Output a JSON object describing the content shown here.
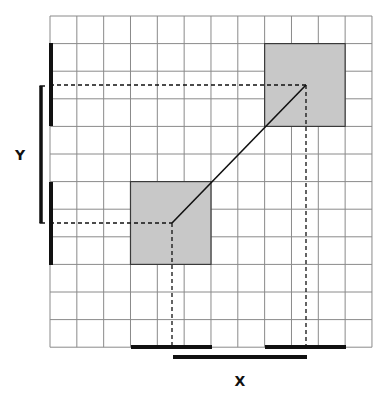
{
  "diagram": {
    "type": "grid-displacement",
    "grid": {
      "origin_x": 50,
      "origin_y": 16,
      "cols": 12,
      "rows": 12,
      "cell_width": 26.83,
      "cell_height": 27.6,
      "line_color": "#8a8a8a"
    },
    "squares": [
      {
        "name": "lower-left-square",
        "col": 3,
        "row": 6,
        "span_cols": 3,
        "span_rows": 3
      },
      {
        "name": "upper-right-square",
        "col": 8,
        "row": 1,
        "span_cols": 3,
        "span_rows": 3
      }
    ],
    "square_fill": "#c8c8c8",
    "square_stroke": "#3a3a3a",
    "centers": [
      {
        "name": "lower-left-center",
        "x": 172,
        "y": 223
      },
      {
        "name": "upper-right-center",
        "x": 306,
        "y": 85
      }
    ],
    "y_axis": {
      "label": "Y",
      "label_x": 20,
      "label_y": 160,
      "edge_bars": [
        {
          "x": 51,
          "y1": 43,
          "y2": 126
        },
        {
          "x": 51,
          "y1": 182,
          "y2": 265
        }
      ],
      "bracket": {
        "x": 41,
        "y1": 86,
        "y2": 223
      }
    },
    "x_axis": {
      "label": "X",
      "label_x": 240,
      "label_y": 386,
      "edge_bars": [
        {
          "y": 347,
          "x1": 131,
          "x2": 212
        },
        {
          "y": 347,
          "x1": 265,
          "x2": 346
        }
      ],
      "distance_bar": {
        "y": 357,
        "x1": 173,
        "x2": 307
      }
    },
    "ink_color": "#111111"
  }
}
